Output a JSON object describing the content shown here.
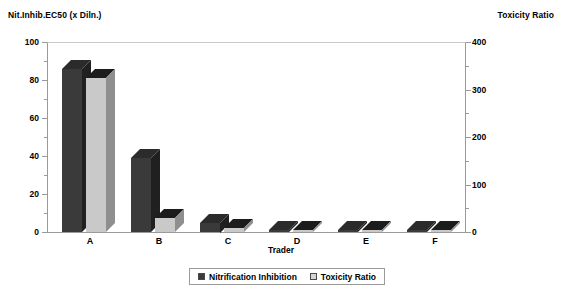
{
  "chart_data": {
    "type": "bar",
    "title": "",
    "xlabel": "Trader",
    "categories": [
      "A",
      "B",
      "C",
      "D",
      "E",
      "F"
    ],
    "series": [
      {
        "name": "Nitrification Inhibition",
        "axis": "left",
        "color": "#3a3a3a",
        "values": [
          86,
          39,
          5,
          1,
          1,
          1
        ]
      },
      {
        "name": "Toxicity Ratio",
        "axis": "right",
        "color": "#c9c9c9",
        "values": [
          324,
          30,
          8,
          4,
          4,
          4
        ]
      }
    ],
    "left_axis": {
      "label": "Nit.Inhib.EC50 (x Diln.)",
      "ticks": [
        "0",
        "20",
        "40",
        "60",
        "80",
        "100"
      ],
      "min": 0,
      "max": 100
    },
    "right_axis": {
      "label": "Toxicity Ratio",
      "ticks": [
        "0",
        "100",
        "200",
        "300",
        "400"
      ],
      "min": 0,
      "max": 400
    },
    "grid": false,
    "legend_position": "bottom"
  },
  "axes": {
    "left_title": "Nit.Inhib.EC50 (x Diln.)",
    "right_title": "Toxicity Ratio",
    "x_title": "Trader",
    "left_ticks": [
      "100",
      "80",
      "60",
      "40",
      "20",
      "0"
    ],
    "right_ticks": [
      "400",
      "300",
      "200",
      "100",
      "0"
    ],
    "x_ticks": [
      "A",
      "B",
      "C",
      "D",
      "E",
      "F"
    ]
  },
  "legend": {
    "items": [
      {
        "label": "Nitrification Inhibition",
        "color": "#3a3a3a"
      },
      {
        "label": "Toxicity Ratio",
        "color": "#c9c9c9"
      }
    ]
  },
  "colors": {
    "series1": "#3a3a3a",
    "series1_top": "#2b2b2b",
    "series1_side": "#202020",
    "series2": "#c9c9c9",
    "series2_top": "#1c1c1c",
    "series2_side": "#8f8f8f",
    "axis": "#9a9a9a"
  }
}
